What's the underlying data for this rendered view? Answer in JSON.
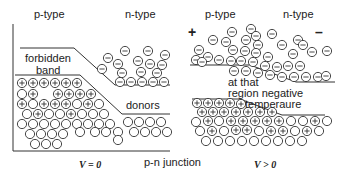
{
  "left_panel": {
    "p_label": "p-type",
    "n_label": "n-type",
    "band_label_1": "forbidden",
    "band_label_2": "band",
    "donors_label": "donors",
    "voltage_label": "V = 0"
  },
  "center": {
    "caption": "p-n junction"
  },
  "right_panel": {
    "p_label": "p-type",
    "n_label": "n-type",
    "plus_sign": "+",
    "minus_sign": "–",
    "note_1": "at that",
    "note_2": "region negative",
    "note_3": "temperaure",
    "voltage_label": "V > 0"
  },
  "colors": {
    "line": "#333333",
    "particle_stroke": "#333333",
    "background": "#ffffff"
  }
}
